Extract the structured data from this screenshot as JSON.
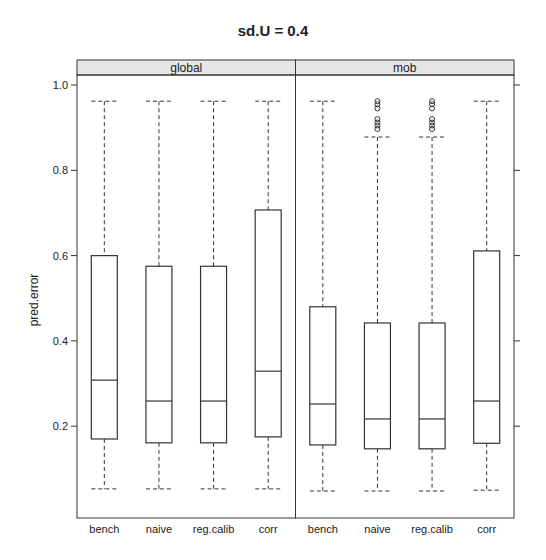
{
  "chart_data": {
    "type": "box",
    "title": "sd.U =  0.4",
    "xlabel": "",
    "ylabel": "pred.error",
    "ylim": [
      0.0,
      1.02
    ],
    "yticks": [
      0.2,
      0.4,
      0.6,
      0.8,
      1.0
    ],
    "ytick_labels": [
      "0.2",
      "0.4",
      "0.6",
      "0.8",
      "1.0"
    ],
    "grid": false,
    "categories": [
      "bench",
      "naive",
      "reg.calib",
      "corr"
    ],
    "panels": [
      {
        "name": "global",
        "boxes": [
          {
            "category": "bench",
            "whisker_low": 0.053,
            "q1": 0.17,
            "median": 0.308,
            "q3": 0.6,
            "whisker_high": 0.962,
            "outliers": []
          },
          {
            "category": "naive",
            "whisker_low": 0.053,
            "q1": 0.161,
            "median": 0.259,
            "q3": 0.575,
            "whisker_high": 0.962,
            "outliers": []
          },
          {
            "category": "reg.calib",
            "whisker_low": 0.053,
            "q1": 0.161,
            "median": 0.259,
            "q3": 0.575,
            "whisker_high": 0.962,
            "outliers": []
          },
          {
            "category": "corr",
            "whisker_low": 0.053,
            "q1": 0.175,
            "median": 0.329,
            "q3": 0.707,
            "whisker_high": 0.962,
            "outliers": []
          }
        ]
      },
      {
        "name": "mob",
        "boxes": [
          {
            "category": "bench",
            "whisker_low": 0.048,
            "q1": 0.156,
            "median": 0.252,
            "q3": 0.48,
            "whisker_high": 0.962,
            "outliers": []
          },
          {
            "category": "naive",
            "whisker_low": 0.048,
            "q1": 0.147,
            "median": 0.217,
            "q3": 0.442,
            "whisker_high": 0.878,
            "outliers": [
              0.962,
              0.955,
              0.945,
              0.92,
              0.912,
              0.905,
              0.897
            ]
          },
          {
            "category": "reg.calib",
            "whisker_low": 0.048,
            "q1": 0.147,
            "median": 0.217,
            "q3": 0.442,
            "whisker_high": 0.878,
            "outliers": [
              0.962,
              0.955,
              0.945,
              0.92,
              0.912,
              0.905,
              0.897
            ]
          },
          {
            "category": "corr",
            "whisker_low": 0.05,
            "q1": 0.16,
            "median": 0.259,
            "q3": 0.611,
            "whisker_high": 0.962,
            "outliers": []
          }
        ]
      }
    ]
  },
  "colors": {
    "strip_fill": "#e6e6e6",
    "line": "#333333",
    "background": "#ffffff"
  }
}
